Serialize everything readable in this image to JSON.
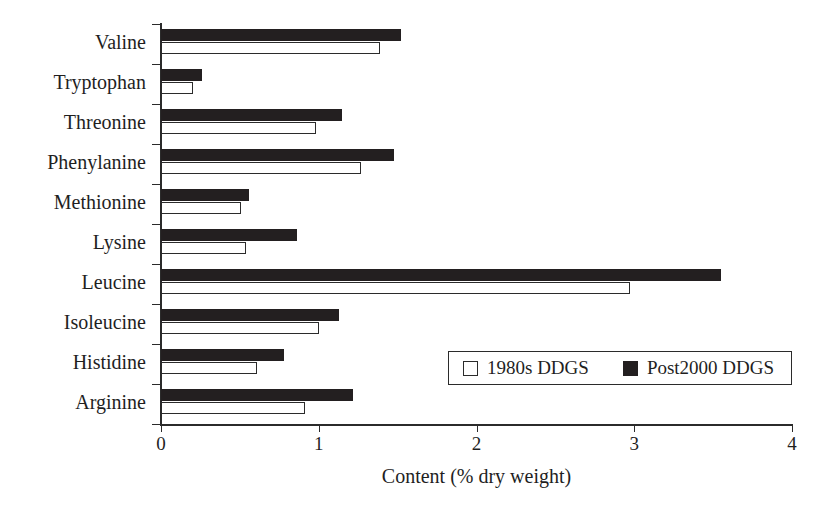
{
  "chart_data": {
    "type": "bar",
    "orientation": "horizontal",
    "title": "",
    "xlabel": "Content (% dry weight)",
    "ylabel": "",
    "xlim": [
      0,
      4
    ],
    "xticks": [
      "0",
      "1",
      "2",
      "3",
      "4"
    ],
    "grid": false,
    "legend_position": "inside-lower-right",
    "categories": [
      "Valine",
      "Tryptophan",
      "Threonine",
      "Phenylanine",
      "Methionine",
      "Lysine",
      "Leucine",
      "Isoleucine",
      "Histidine",
      "Arginine"
    ],
    "series": [
      {
        "name": "1980s DDGS",
        "color": "#ffffff",
        "edge_color": "#2b2b2b",
        "values": [
          1.39,
          0.2,
          0.98,
          1.27,
          0.51,
          0.54,
          2.97,
          1.0,
          0.61,
          0.91
        ]
      },
      {
        "name": "Post2000 DDGS",
        "color": "#231f20",
        "edge_color": "#231f20",
        "values": [
          1.52,
          0.26,
          1.15,
          1.48,
          0.56,
          0.86,
          3.55,
          1.13,
          0.78,
          1.22
        ]
      }
    ]
  },
  "legend": {
    "entries": [
      {
        "label": "1980s DDGS",
        "swatch": "open-square-swatch"
      },
      {
        "label": "Post2000 DDGS",
        "swatch": "filled-square-swatch"
      }
    ]
  },
  "axis": {
    "x_title": "Content (% dry weight)",
    "x_tick_labels": [
      "0",
      "1",
      "2",
      "3",
      "4"
    ]
  }
}
